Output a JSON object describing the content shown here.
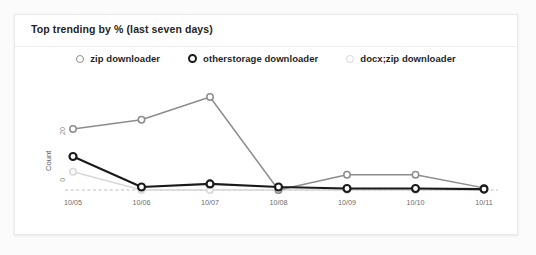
{
  "card": {
    "title": "Top trending by % (last seven days)"
  },
  "legend": {
    "position": "top-center",
    "items": [
      {
        "label": "zip downloader",
        "color": "#8c8c8c",
        "marker": "ring-circle-icon"
      },
      {
        "label": "otherstorage downloader",
        "color": "#1a1a1a",
        "marker": "ring-circle-icon"
      },
      {
        "label": "docx;zip downloader",
        "color": "#d8d8d8",
        "marker": "ring-circle-icon"
      }
    ]
  },
  "axis": {
    "y_title": "Count",
    "y_ticks": [
      "20",
      "0"
    ],
    "x_ticks": [
      "10/05",
      "10/06",
      "10/07",
      "10/08",
      "10/09",
      "10/10",
      "10/11"
    ],
    "caption": "Chart time zone: (UTC)"
  },
  "chart_data": {
    "type": "line",
    "title": "Top trending by % (last seven days)",
    "xlabel": "",
    "ylabel": "Count",
    "categories": [
      "10/05",
      "10/06",
      "10/07",
      "10/08",
      "10/09",
      "10/10",
      "10/11"
    ],
    "ylim": [
      0,
      30
    ],
    "yticks": [
      0,
      20
    ],
    "grid": false,
    "baseline_dashed": true,
    "legend_position": "top-center",
    "annotations": [
      "Chart time zone: (UTC)"
    ],
    "series": [
      {
        "name": "zip downloader",
        "color": "#8c8c8c",
        "values": [
          20,
          23,
          30.5,
          0,
          5,
          5,
          0.7
        ]
      },
      {
        "name": "otherstorage downloader",
        "color": "#1a1a1a",
        "values": [
          11,
          1,
          2,
          1,
          0.5,
          0.5,
          0.3
        ]
      },
      {
        "name": "docx;zip downloader",
        "color": "#d8d8d8",
        "values": [
          6,
          0,
          0,
          0,
          0,
          0,
          0
        ]
      }
    ]
  }
}
